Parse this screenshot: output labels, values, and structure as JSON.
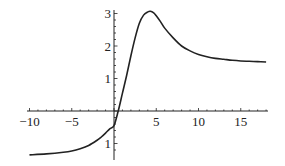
{
  "chart_data": {
    "type": "line",
    "title": "",
    "xlabel": "",
    "ylabel": "",
    "xlim": [
      -10,
      18
    ],
    "ylim": [
      -1.35,
      3.1
    ],
    "grid": false,
    "legend": null,
    "x_ticks": [
      -10,
      -5,
      5,
      10,
      15
    ],
    "x_tick_labels": [
      "−10",
      "−5",
      "5",
      "10",
      "15"
    ],
    "y_ticks": [
      -1,
      1,
      2,
      3
    ],
    "y_tick_labels": [
      "1",
      "1",
      "2",
      "3"
    ],
    "series": [
      {
        "name": "f(x)",
        "color": "#222222",
        "x": [
          -10,
          -8,
          -6,
          -5,
          -4,
          -3,
          -2,
          -1.5,
          -1,
          -0.5,
          0,
          0.5,
          1,
          1.5,
          2,
          2.5,
          3,
          3.5,
          4,
          4.3,
          4.7,
          5,
          5.5,
          6,
          7,
          8,
          9,
          10,
          11,
          12,
          13,
          14,
          15,
          16,
          17,
          18
        ],
        "y": [
          -1.35,
          -1.32,
          -1.27,
          -1.23,
          -1.16,
          -1.06,
          -0.9,
          -0.8,
          -0.68,
          -0.55,
          -0.45,
          0.0,
          0.55,
          1.1,
          1.7,
          2.25,
          2.7,
          2.95,
          3.05,
          3.07,
          3.02,
          2.93,
          2.75,
          2.55,
          2.25,
          2.0,
          1.85,
          1.74,
          1.67,
          1.62,
          1.59,
          1.56,
          1.54,
          1.53,
          1.52,
          1.51
        ]
      }
    ]
  }
}
